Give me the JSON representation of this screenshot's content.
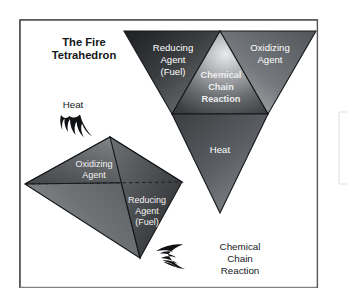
{
  "figure": {
    "title_line1": "The Fire",
    "title_line2": "Tetrahedron",
    "background_color": "#ffffff",
    "frame_color": "#6f7277"
  },
  "inverted_pyramid": {
    "left_face": {
      "line1": "Reducing",
      "line2": "Agent",
      "line3": "(Fuel)"
    },
    "right_face": {
      "line1": "Oxidizing",
      "line2": "Agent"
    },
    "center_face": {
      "line1": "Chemical",
      "line2": "Chain",
      "line3": "Reaction"
    },
    "bottom_face": {
      "line1": "Heat"
    }
  },
  "tetrahedron": {
    "left_face": {
      "line1": "Oxidizing",
      "line2": "Agent"
    },
    "right_face": {
      "line1": "Reducing",
      "line2": "Agent",
      "line3": "(Fuel)"
    }
  },
  "callouts": {
    "heat": {
      "line1": "Heat"
    },
    "chain_reaction": {
      "line1": "Chemical",
      "line2": "Chain",
      "line3": "Reaction"
    }
  },
  "colors": {
    "dark_face": "#2c2e31",
    "mid_face": "#6b6e72",
    "light_face": "#b9bbbd",
    "highlight": "#e8e9ea",
    "outline": "#17181a",
    "flame": "#101114"
  }
}
